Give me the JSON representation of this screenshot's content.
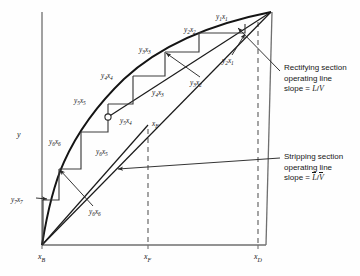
{
  "figure": {
    "type": "mccabe-thiele-diagram",
    "axis": {
      "ylabel": "y",
      "xticks": [
        "x_B",
        "x_F",
        "x_D"
      ]
    },
    "axis_labels": {
      "y": "y",
      "xB_main": "x",
      "xB_sub": "B",
      "xF_main": "x",
      "xF_sub": "F",
      "xD_main": "x",
      "xD_sub": "D"
    },
    "feed_marker_label": {
      "main": "x",
      "sub": "F"
    },
    "stage_labels": [
      {
        "name": "y1x1",
        "y_main": "y",
        "y_sub": "1",
        "x_main": "x",
        "x_sub": "1",
        "left": 216,
        "top": 13
      },
      {
        "name": "y2x2",
        "y_main": "y",
        "y_sub": "2",
        "x_main": "x",
        "x_sub": "2",
        "left": 184,
        "top": 26
      },
      {
        "name": "y3x3",
        "y_main": "y",
        "y_sub": "3",
        "x_main": "x",
        "x_sub": "3",
        "left": 139,
        "top": 46
      },
      {
        "name": "y4x4",
        "y_main": "y",
        "y_sub": "4",
        "x_main": "x",
        "x_sub": "4",
        "left": 101,
        "top": 72
      },
      {
        "name": "y5x5",
        "y_main": "y",
        "y_sub": "5",
        "x_main": "x",
        "x_sub": "5",
        "left": 74,
        "top": 97
      },
      {
        "name": "y6x6",
        "y_main": "y",
        "y_sub": "6",
        "x_main": "x",
        "x_sub": "6",
        "left": 49,
        "top": 138
      },
      {
        "name": "y7x7",
        "y_main": "y",
        "y_sub": "7",
        "x_main": "x",
        "x_sub": "7",
        "left": 11,
        "top": 196
      },
      {
        "name": "y2x1",
        "y_main": "y",
        "y_sub": "2",
        "x_main": "x",
        "x_sub": "1",
        "left": 222,
        "top": 57
      },
      {
        "name": "y3x2",
        "y_main": "y",
        "y_sub": "3",
        "x_main": "x",
        "x_sub": "2",
        "left": 190,
        "top": 79
      },
      {
        "name": "y4x3",
        "y_main": "y",
        "y_sub": "4",
        "x_main": "x",
        "x_sub": "3",
        "left": 152,
        "top": 89
      },
      {
        "name": "y5x4",
        "y_main": "y",
        "y_sub": "5",
        "x_main": "x",
        "x_sub": "4",
        "left": 120,
        "top": 117
      },
      {
        "name": "y6x5",
        "y_main": "y",
        "y_sub": "6",
        "x_main": "x",
        "x_sub": "5",
        "left": 96,
        "top": 148
      },
      {
        "name": "y7x6",
        "y_main": "y",
        "y_sub": "6",
        "x_main": "x",
        "x_sub": "6",
        "left": 80,
        "top": 210
      }
    ],
    "annotations": [
      {
        "name": "rectifying-section-note",
        "line1": "Rectifying section",
        "line2": "operating line",
        "slope_prefix": "slope = ",
        "slope_num": "L",
        "slope_den": "V",
        "overbar": false,
        "left": 282,
        "top": 66
      },
      {
        "name": "stripping-section-note",
        "line1": "Stripping section",
        "line2": "operating line",
        "slope_prefix": "slope = ",
        "slope_num": "L",
        "slope_den": "V",
        "overbar": true,
        "left": 282,
        "top": 155
      }
    ],
    "colors": {
      "ink": "#171717",
      "curve": "#1a1a1a",
      "grid": "#707070",
      "dashed": "#5a5a5a",
      "background": "#fefefe"
    },
    "geometry": {
      "origin": [
        42,
        245
      ],
      "top_right": [
        271,
        12
      ],
      "xF_x": 148,
      "xD_x": 258,
      "feed_point": [
        108,
        117
      ]
    }
  }
}
